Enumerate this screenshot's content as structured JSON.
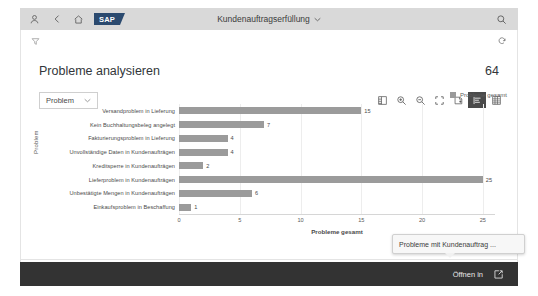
{
  "shell": {
    "icons": [
      {
        "name": "user-icon",
        "glyph": "user"
      },
      {
        "name": "back-icon",
        "glyph": "chevron-left"
      },
      {
        "name": "home-icon",
        "glyph": "home"
      }
    ],
    "logo_text": "SAP",
    "title": "Kundenauftragserfüllung",
    "title_chevron": "⌄",
    "search_icon": "search-icon"
  },
  "subheader": {
    "left_icon": "filter-icon",
    "right_icon": "refresh-icon"
  },
  "header": {
    "title": "Probleme analysieren",
    "count": "64"
  },
  "toolbar": {
    "dimension_label": "Problem",
    "dimension_chevron": "⌄",
    "buttons": [
      {
        "name": "details-table-icon",
        "label": "Details",
        "active": false
      },
      {
        "name": "zoom-in-icon",
        "label": "Vergrößern",
        "active": false
      },
      {
        "name": "zoom-out-icon",
        "label": "Verkleinern",
        "active": false
      },
      {
        "name": "fullscreen-icon",
        "label": "Vollbild",
        "active": false
      },
      {
        "name": "drill-down-icon",
        "label": "Drilldown",
        "active": false
      },
      {
        "name": "bar-chart-icon",
        "label": "Balkendiagramm",
        "active": true
      },
      {
        "name": "grid-table-icon",
        "label": "Tabelle",
        "active": false
      }
    ]
  },
  "legend": {
    "items": [
      {
        "label": "Probleme gesamt",
        "color": "#9a9a9a"
      }
    ]
  },
  "chart_data": {
    "type": "bar",
    "orientation": "horizontal",
    "title": "",
    "xlabel": "Probleme gesamt",
    "ylabel": "Problem",
    "categories": [
      "Versandproblem in Lieferung",
      "Kein Buchhaltungsbeleg angelegt",
      "Fakturierungsproblem in Lieferung",
      "Unvollständige Daten in Kundenaufträgen",
      "Kreditsperre in Kundenaufträgen",
      "Lieferproblem in Kundenaufträgen",
      "Unbestätigte Mengen in Kundenaufträgen",
      "Einkaufsproblem in Beschaffung"
    ],
    "values": [
      15,
      7,
      4,
      4,
      2,
      25,
      6,
      1
    ],
    "series": [
      {
        "name": "Probleme gesamt",
        "color": "#9b9b9b",
        "values": [
          15,
          7,
          4,
          4,
          2,
          25,
          6,
          1
        ]
      }
    ],
    "xticks": [
      0,
      5,
      10,
      15,
      20,
      25
    ],
    "xlim": [
      0,
      26
    ],
    "grid": true,
    "legend_position": "top-right"
  },
  "tooltip": {
    "text": "Probleme mit Kundenauftrag ..."
  },
  "bottom_bar": {
    "label": "Öffnen in",
    "icon": "open-external-icon"
  }
}
